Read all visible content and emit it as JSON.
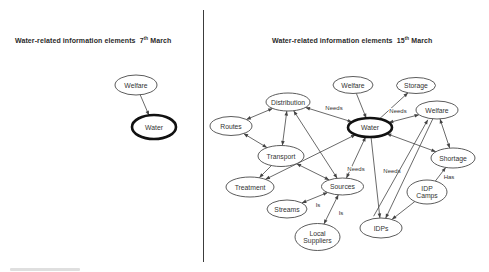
{
  "panels": {
    "left": {
      "title": {
        "before": "Water-related information elements  7",
        "sup": "th",
        "after": " March"
      }
    },
    "right": {
      "title": {
        "before": "Water-related information elements  15",
        "sup": "th",
        "after": " March"
      }
    }
  },
  "divider": {
    "x": 203,
    "y1": 10,
    "y2": 262
  },
  "diagram": {
    "colors": {
      "node_fill": "#ffffff",
      "node_stroke": "#4a4a4a",
      "water_stroke": "#111111",
      "edge": "#444444",
      "text": "#333333"
    },
    "nodes": [
      {
        "id": "l_welfare",
        "label": "Welfare",
        "x": 136,
        "y": 85,
        "rx": 21,
        "ry": 10
      },
      {
        "id": "l_water",
        "label": "Water",
        "x": 154,
        "y": 127,
        "rx": 22,
        "ry": 12,
        "thick": true
      },
      {
        "id": "welfare_top",
        "label": "Welfare",
        "x": 353,
        "y": 85,
        "rx": 20,
        "ry": 8.5
      },
      {
        "id": "storage",
        "label": "Storage",
        "x": 416,
        "y": 85.5,
        "rx": 19.5,
        "ry": 8
      },
      {
        "id": "distribution",
        "label": "Distribution",
        "x": 288,
        "y": 102,
        "rx": 22,
        "ry": 9
      },
      {
        "id": "welfare_right",
        "label": "Welfare",
        "x": 437,
        "y": 110,
        "rx": 21,
        "ry": 9
      },
      {
        "id": "routes",
        "label": "Routes",
        "x": 231,
        "y": 126,
        "rx": 21,
        "ry": 9.5
      },
      {
        "id": "water",
        "label": "Water",
        "x": 370,
        "y": 127.5,
        "rx": 22,
        "ry": 9.5,
        "thick": true
      },
      {
        "id": "transport",
        "label": "Transport",
        "x": 281,
        "y": 156,
        "rx": 23,
        "ry": 10.5
      },
      {
        "id": "shortage",
        "label": "Shortage",
        "x": 453,
        "y": 158,
        "rx": 22,
        "ry": 10
      },
      {
        "id": "treatment",
        "label": "Treatment",
        "x": 250,
        "y": 187,
        "rx": 24,
        "ry": 10
      },
      {
        "id": "sources",
        "label": "Sources",
        "x": 342.5,
        "y": 186.5,
        "rx": 21,
        "ry": 8.5
      },
      {
        "id": "idp_camps",
        "label": [
          "IDP",
          "Camps"
        ],
        "x": 427,
        "y": 192,
        "rx": 20,
        "ry": 12
      },
      {
        "id": "streams",
        "label": "Streams",
        "x": 287,
        "y": 209,
        "rx": 20,
        "ry": 9
      },
      {
        "id": "local_suppliers",
        "label": [
          "Local",
          "Suppliers"
        ],
        "x": 317.5,
        "y": 237,
        "rx": 22.5,
        "ry": 13.5
      },
      {
        "id": "idps",
        "label": "IDPs",
        "x": 381,
        "y": 228,
        "rx": 21,
        "ry": 10
      }
    ],
    "edges": [
      {
        "from": "l_welfare",
        "to": "l_water",
        "dir": "to"
      },
      {
        "from": "welfare_top",
        "to": "water",
        "dir": "to"
      },
      {
        "from": "water",
        "to": "storage",
        "dir": "to"
      },
      {
        "from": "water",
        "to": "welfare_right",
        "dir": "both",
        "label": "Needs",
        "lx": 398,
        "ly": 113
      },
      {
        "from": "water",
        "to": "distribution",
        "dir": "both",
        "label": "Needs",
        "lx": 334,
        "ly": 110
      },
      {
        "from": "water",
        "to": "shortage",
        "dir": "both"
      },
      {
        "from": "water",
        "to": "sources",
        "dir": "both",
        "label": "Needs",
        "lx": 356,
        "ly": 171
      },
      {
        "from": "water",
        "to": "idps",
        "dir": "to",
        "label": "Needs",
        "lx": 392,
        "ly": 173
      },
      {
        "from": "water",
        "to": "treatment",
        "dir": "both"
      },
      {
        "from": "welfare_right",
        "to": "shortage",
        "dir": "both"
      },
      {
        "from": "welfare_right",
        "to": "idps",
        "dir": "to"
      },
      {
        "from": "idps",
        "to": "welfare_right",
        "dir": "to",
        "off": [
          -12,
          -2,
          -5,
          1
        ]
      },
      {
        "from": "idp_camps",
        "to": "shortage",
        "dir": "to",
        "label": "Has",
        "lx": 449,
        "ly": 179
      },
      {
        "from": "idp_camps",
        "to": "idps",
        "dir": "to"
      },
      {
        "from": "streams",
        "to": "sources",
        "dir": "both",
        "label": "Is",
        "lx": 318,
        "ly": 207
      },
      {
        "from": "local_suppliers",
        "to": "sources",
        "dir": "both",
        "label": "Is",
        "lx": 341,
        "ly": 215
      },
      {
        "from": "routes",
        "to": "distribution",
        "dir": "both"
      },
      {
        "from": "routes",
        "to": "transport",
        "dir": "both"
      },
      {
        "from": "distribution",
        "to": "transport",
        "dir": "both"
      },
      {
        "from": "distribution",
        "to": "sources",
        "dir": "both"
      },
      {
        "from": "transport",
        "to": "treatment",
        "dir": "to"
      },
      {
        "from": "transport",
        "to": "sources",
        "dir": "both"
      }
    ]
  }
}
